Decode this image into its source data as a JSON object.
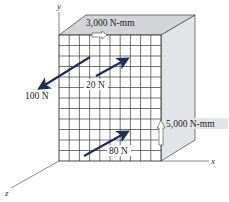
{
  "figure": {
    "axes": {
      "x_label": "x",
      "y_label": "y",
      "z_label": "z"
    },
    "moments": [
      {
        "id": "top",
        "label": "3,000 N-mm",
        "face": "top",
        "direction": "+x"
      },
      {
        "id": "side",
        "label": "5,000 N-mm",
        "face": "right",
        "direction": "+y"
      }
    ],
    "forces": [
      {
        "id": "f100",
        "label": "100 N",
        "direction": "toward -x/+z (down-left)"
      },
      {
        "id": "f20",
        "label": "20 N",
        "direction": "toward +x/-z (up-right)"
      },
      {
        "id": "f80",
        "label": "80 N",
        "direction": "toward +x/-z (up-right)"
      }
    ],
    "grid": {
      "columns": 10,
      "rows": 12
    },
    "colors": {
      "top_face": "#d4d6d8",
      "side_face": "#e0e2e5",
      "front_face": "#ffffff",
      "grid_line": "#3a3a3a",
      "force_arrow": "#1f2d5a",
      "axis_line": "#555555"
    }
  }
}
